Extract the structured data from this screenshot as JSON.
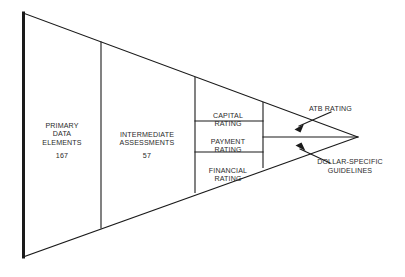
{
  "diagram": {
    "type": "funnel-triangle",
    "title": "",
    "background_color": "#ffffff",
    "line_color": "#1a1a1a",
    "text_color": "#2b2b2b",
    "segments": [
      {
        "id": "primary-data-elements",
        "label": "PRIMARY\nDATA\nELEMENTS",
        "count": "167"
      },
      {
        "id": "intermediate-assessments",
        "label": "INTERMEDIATE\nASSESSMENTS",
        "count": "57"
      },
      {
        "id": "capital-rating",
        "label": "CAPITAL\nRATING",
        "count": ""
      },
      {
        "id": "payment-rating",
        "label": "PAYMENT\nRATING",
        "count": ""
      },
      {
        "id": "financial-rating",
        "label": "FINANCIAL\nRATING",
        "count": ""
      }
    ],
    "callouts": [
      {
        "id": "atb-rating",
        "label": "ATB RATING",
        "arrow_direction": "down-left"
      },
      {
        "id": "dollar-specific-guidelines",
        "label": "DOLLAR-SPECIFIC\nGUIDELINES",
        "arrow_direction": "up-left"
      }
    ]
  }
}
